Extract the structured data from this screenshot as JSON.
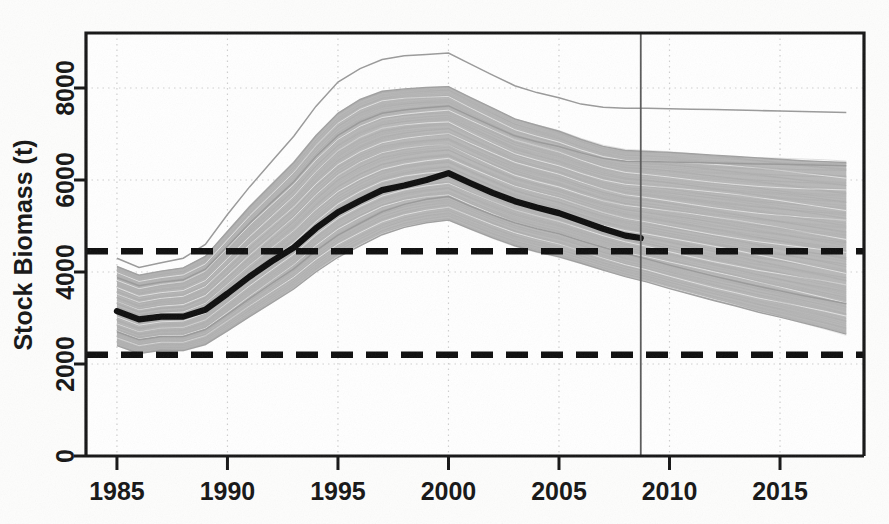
{
  "figure": {
    "name": "stock-biomass-projection-plot",
    "background_color": "#fdfdfc",
    "axis_color": "#151515",
    "band_color": "#b5b5b5",
    "median_color": "#0d0d0d",
    "reference_line_color": "#0d0d0d",
    "grid_color": "#cfcfcf"
  },
  "axes": {
    "y_label": "Stock Biomass (t)",
    "y_ticks": [
      "0",
      "2000",
      "4000",
      "6000",
      "8000"
    ],
    "x_ticks": [
      "1985",
      "1990",
      "1995",
      "2000",
      "2005",
      "2010",
      "2015"
    ]
  },
  "chart_data": {
    "type": "line",
    "title": "",
    "xlabel": "",
    "ylabel": "Stock Biomass (t)",
    "xlim": [
      1983.6,
      2018.8
    ],
    "ylim": [
      0,
      9000
    ],
    "xticks": [
      1985,
      1990,
      1995,
      2000,
      2005,
      2010,
      2015
    ],
    "yticks": [
      0,
      2000,
      4000,
      6000,
      8000
    ],
    "grid": true,
    "legend": "none",
    "x": [
      1985,
      1986,
      1987,
      1988,
      1989,
      1990,
      1991,
      1992,
      1993,
      1994,
      1995,
      1996,
      1997,
      1998,
      1999,
      2000,
      2001,
      2002,
      2003,
      2004,
      2005,
      2006,
      2007,
      2008,
      2009,
      2010,
      2011,
      2012,
      2013,
      2014,
      2015,
      2016,
      2017,
      2018
    ],
    "series": [
      {
        "name": "Median stock biomass (historical estimate)",
        "style": "thick-black-line",
        "x": [
          1985,
          1986,
          1987,
          1988,
          1989,
          1990,
          1991,
          1992,
          1993,
          1994,
          1995,
          1996,
          1997,
          1998,
          1999,
          2000,
          2001,
          2002,
          2003,
          2004,
          2005,
          2006,
          2007,
          2008,
          2008.7
        ],
        "values": [
          3150,
          2970,
          3030,
          3030,
          3180,
          3530,
          3900,
          4230,
          4530,
          4950,
          5300,
          5550,
          5780,
          5880,
          6000,
          6150,
          5930,
          5720,
          5540,
          5400,
          5280,
          5110,
          4940,
          4790,
          4740
        ]
      },
      {
        "name": "Upper envelope of biomass trajectories",
        "style": "light-grey-band-top",
        "values": [
          4120,
          3930,
          4020,
          4090,
          4340,
          4880,
          5420,
          5900,
          6380,
          6960,
          7450,
          7750,
          7930,
          7980,
          8010,
          8030,
          7790,
          7560,
          7330,
          7190,
          7060,
          6880,
          6730,
          6640,
          6620,
          6600,
          6570,
          6540,
          6510,
          6480,
          6450,
          6420,
          6400,
          6380
        ]
      },
      {
        "name": "Lower envelope of biomass trajectories",
        "style": "light-grey-band-bottom",
        "values": [
          2400,
          2230,
          2300,
          2290,
          2420,
          2720,
          3030,
          3330,
          3630,
          4000,
          4320,
          4570,
          4810,
          4970,
          5070,
          5130,
          4930,
          4740,
          4570,
          4440,
          4330,
          4190,
          4040,
          3900,
          3780,
          3640,
          3510,
          3380,
          3260,
          3130,
          3020,
          2900,
          2780,
          2650
        ]
      },
      {
        "name": "Extreme high outlier trajectory",
        "style": "thin-grey-line",
        "values": [
          4300,
          4100,
          4200,
          4300,
          4600,
          5250,
          5850,
          6400,
          6950,
          7600,
          8130,
          8420,
          8620,
          8700,
          8730,
          8760,
          8520,
          8280,
          8050,
          7900,
          7790,
          7650,
          7580,
          7560,
          7560,
          7550,
          7540,
          7530,
          7520,
          7510,
          7500,
          7490,
          7480,
          7470
        ]
      },
      {
        "name": "Interior quantile trajectory upper",
        "style": "thin-grey-line",
        "values": [
          3880,
          3700,
          3780,
          3830,
          4060,
          4560,
          5060,
          5520,
          5960,
          6510,
          6970,
          7260,
          7450,
          7520,
          7570,
          7610,
          7390,
          7170,
          6960,
          6830,
          6730,
          6590,
          6470,
          6410,
          6400,
          6390,
          6380,
          6370,
          6360,
          6350,
          6340,
          6330,
          6320,
          6310
        ]
      },
      {
        "name": "Interior quantile trajectory lower",
        "style": "thin-grey-line",
        "values": [
          2700,
          2530,
          2600,
          2600,
          2750,
          3080,
          3420,
          3750,
          4070,
          4460,
          4800,
          5060,
          5310,
          5470,
          5580,
          5640,
          5430,
          5240,
          5070,
          4940,
          4830,
          4680,
          4540,
          4400,
          4280,
          4150,
          4030,
          3910,
          3800,
          3690,
          3590,
          3490,
          3400,
          3310
        ]
      }
    ],
    "reference_lines": [
      {
        "name": "upper-reference-limit",
        "value": 4450,
        "style": "thick-black-dashed"
      },
      {
        "name": "lower-reference-limit",
        "value": 2200,
        "style": "thick-black-dashed"
      }
    ],
    "vertical_markers": [
      {
        "name": "projection-start-line",
        "value": 2008.7,
        "style": "thin-solid-grey"
      }
    ]
  }
}
